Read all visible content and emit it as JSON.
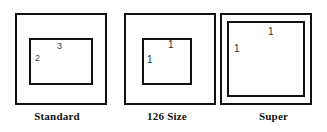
{
  "figure": {
    "type": "diagram",
    "panels": [
      {
        "id": "standard",
        "caption": "Standard",
        "outer_frame": {
          "shape": "square"
        },
        "inner_area": {
          "shape": "rectangle",
          "width_label": "3",
          "height_label": "2"
        },
        "labels": {
          "top": "3",
          "left": "2"
        }
      },
      {
        "id": "126-size",
        "caption": "126 Size",
        "outer_frame": {
          "shape": "square"
        },
        "inner_area": {
          "shape": "square",
          "width_label": "1",
          "height_label": "1"
        },
        "labels": {
          "top": "1",
          "left": "1"
        }
      },
      {
        "id": "super",
        "caption": "Super",
        "outer_frame": {
          "shape": "square"
        },
        "inner_area": {
          "shape": "square",
          "width_label": "1",
          "height_label": "1"
        },
        "labels": {
          "top": "1",
          "left": "1"
        }
      }
    ]
  },
  "colors": {
    "background": "#ffffff",
    "stroke": "#111111",
    "label_text": "#3b3b3b",
    "caption_text": "#111111"
  }
}
